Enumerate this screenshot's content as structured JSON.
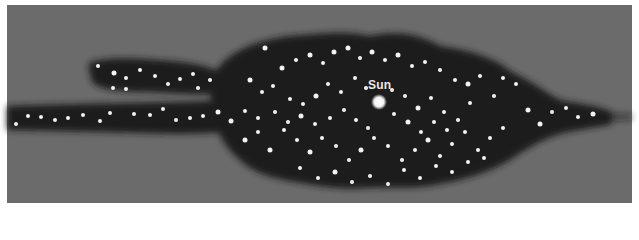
{
  "diagram": {
    "type": "star-distribution-cross-section",
    "colors": {
      "background": "#6b6b6b",
      "galaxy": "#1a1a1a",
      "star": "#f2f2f2",
      "label": "#e8e8e8",
      "border": "#ffffff"
    },
    "labels": {
      "sun": "Sun"
    },
    "sun": {
      "x": 379,
      "y": 102,
      "r": 5
    },
    "stars": [
      [
        98,
        66,
        2
      ],
      [
        114,
        73,
        2.5
      ],
      [
        126,
        78,
        2
      ],
      [
        140,
        70,
        2
      ],
      [
        155,
        76,
        2
      ],
      [
        168,
        84,
        2
      ],
      [
        180,
        79,
        2
      ],
      [
        193,
        74,
        2
      ],
      [
        198,
        88,
        2
      ],
      [
        210,
        80,
        2
      ],
      [
        126,
        89,
        2
      ],
      [
        113,
        88,
        2
      ],
      [
        16,
        124,
        2
      ],
      [
        28,
        116,
        2
      ],
      [
        41,
        117,
        2
      ],
      [
        55,
        120,
        2
      ],
      [
        68,
        118,
        2
      ],
      [
        83,
        115,
        2
      ],
      [
        100,
        121,
        2
      ],
      [
        110,
        113,
        2
      ],
      [
        134,
        114,
        2
      ],
      [
        150,
        115,
        2
      ],
      [
        163,
        109,
        2
      ],
      [
        176,
        120,
        2
      ],
      [
        190,
        118,
        2
      ],
      [
        203,
        116,
        2
      ],
      [
        218,
        112,
        2.5
      ],
      [
        231,
        121,
        2.5
      ],
      [
        245,
        111,
        2
      ],
      [
        258,
        118,
        2
      ],
      [
        265,
        48,
        2.5
      ],
      [
        282,
        68,
        2.5
      ],
      [
        296,
        60,
        2
      ],
      [
        310,
        55,
        2.5
      ],
      [
        323,
        63,
        2
      ],
      [
        334,
        52,
        2.5
      ],
      [
        348,
        48,
        2.5
      ],
      [
        360,
        58,
        2
      ],
      [
        372,
        52,
        2.5
      ],
      [
        385,
        60,
        2
      ],
      [
        398,
        55,
        2.5
      ],
      [
        412,
        66,
        2
      ],
      [
        425,
        62,
        2
      ],
      [
        440,
        70,
        2
      ],
      [
        455,
        80,
        2
      ],
      [
        468,
        84,
        2.5
      ],
      [
        480,
        76,
        2
      ],
      [
        494,
        96,
        2
      ],
      [
        503,
        78,
        2
      ],
      [
        516,
        84,
        2
      ],
      [
        528,
        110,
        2.5
      ],
      [
        540,
        124,
        2.5
      ],
      [
        552,
        112,
        2
      ],
      [
        566,
        108,
        2
      ],
      [
        578,
        117,
        2
      ],
      [
        593,
        114,
        2.5
      ],
      [
        250,
        80,
        2.5
      ],
      [
        262,
        92,
        2
      ],
      [
        273,
        86,
        2
      ],
      [
        290,
        99,
        2
      ],
      [
        303,
        104,
        2
      ],
      [
        316,
        96,
        2.5
      ],
      [
        328,
        84,
        2
      ],
      [
        341,
        92,
        2
      ],
      [
        355,
        78,
        2
      ],
      [
        366,
        88,
        2
      ],
      [
        392,
        90,
        2
      ],
      [
        405,
        96,
        2
      ],
      [
        418,
        108,
        2.5
      ],
      [
        431,
        98,
        2
      ],
      [
        444,
        112,
        2
      ],
      [
        458,
        120,
        2
      ],
      [
        470,
        103,
        2
      ],
      [
        245,
        140,
        2.5
      ],
      [
        258,
        132,
        2
      ],
      [
        270,
        150,
        2.5
      ],
      [
        284,
        130,
        2
      ],
      [
        297,
        140,
        2
      ],
      [
        310,
        152,
        2.5
      ],
      [
        322,
        138,
        2
      ],
      [
        336,
        146,
        2
      ],
      [
        349,
        160,
        2
      ],
      [
        361,
        150,
        2.5
      ],
      [
        374,
        138,
        2
      ],
      [
        388,
        146,
        2
      ],
      [
        402,
        160,
        2
      ],
      [
        415,
        150,
        2
      ],
      [
        428,
        140,
        2.5
      ],
      [
        440,
        156,
        2
      ],
      [
        452,
        144,
        2
      ],
      [
        465,
        132,
        2
      ],
      [
        478,
        150,
        2
      ],
      [
        490,
        138,
        2
      ],
      [
        503,
        128,
        2
      ],
      [
        275,
        112,
        2
      ],
      [
        288,
        122,
        2
      ],
      [
        301,
        116,
        2.5
      ],
      [
        315,
        124,
        2
      ],
      [
        330,
        118,
        2
      ],
      [
        344,
        110,
        2
      ],
      [
        356,
        120,
        2
      ],
      [
        368,
        128,
        2
      ],
      [
        394,
        114,
        2
      ],
      [
        408,
        122,
        2.5
      ],
      [
        421,
        132,
        2
      ],
      [
        434,
        122,
        2
      ],
      [
        447,
        130,
        2
      ],
      [
        300,
        168,
        2
      ],
      [
        318,
        178,
        2
      ],
      [
        335,
        172,
        2.5
      ],
      [
        352,
        182,
        2
      ],
      [
        370,
        176,
        2
      ],
      [
        388,
        184,
        2
      ],
      [
        404,
        170,
        2
      ],
      [
        420,
        178,
        2
      ],
      [
        436,
        166,
        2
      ],
      [
        452,
        172,
        2
      ],
      [
        468,
        162,
        2
      ],
      [
        484,
        158,
        2
      ]
    ]
  }
}
